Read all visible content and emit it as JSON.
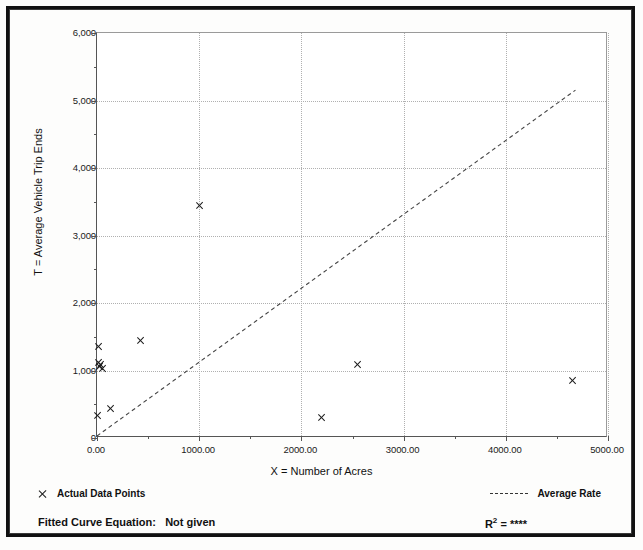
{
  "chart_data": {
    "type": "scatter",
    "title": "",
    "xlabel": "X = Number of Acres",
    "ylabel": "T = Average Vehicle Trip Ends",
    "xlim": [
      0,
      5000
    ],
    "ylim": [
      0,
      6000
    ],
    "grid": true,
    "x_ticks": [
      0,
      1000,
      2000,
      3000,
      4000,
      5000
    ],
    "x_tick_labels": [
      "0.00",
      "1000.00",
      "2000.00",
      "3000.00",
      "4000.00",
      "5000.00"
    ],
    "y_ticks": [
      0,
      1000,
      2000,
      3000,
      4000,
      5000,
      6000
    ],
    "y_tick_labels": [
      "0",
      "1,000",
      "2,000",
      "3,000",
      "4,000",
      "5,000",
      "6,000"
    ],
    "series": [
      {
        "name": "Actual Data Points",
        "marker": "x",
        "points": [
          {
            "x": 20,
            "y": 1350
          },
          {
            "x": 15,
            "y": 1120
          },
          {
            "x": 30,
            "y": 1060
          },
          {
            "x": 55,
            "y": 1030
          },
          {
            "x": 40,
            "y": 1090
          },
          {
            "x": 10,
            "y": 330
          },
          {
            "x": 130,
            "y": 440
          },
          {
            "x": 430,
            "y": 1450
          },
          {
            "x": 1000,
            "y": 3450
          },
          {
            "x": 2200,
            "y": 300
          },
          {
            "x": 2550,
            "y": 1090
          },
          {
            "x": 4650,
            "y": 850
          }
        ]
      },
      {
        "name": "Average Rate",
        "type": "line",
        "style": "dashed",
        "points": [
          {
            "x": 0,
            "y": 0
          },
          {
            "x": 4700,
            "y": 5150
          }
        ]
      }
    ],
    "legend": [
      {
        "marker": "x",
        "label": "Actual Data Points"
      },
      {
        "marker": "dashed-line",
        "label": "Average Rate"
      }
    ],
    "annotations": {
      "fitted_curve_label": "Fitted Curve Equation:",
      "fitted_curve_value": "Not given",
      "r_squared_label": "R",
      "r_squared_exponent": "2",
      "r_squared_equals": "=",
      "r_squared_value": "****"
    }
  }
}
